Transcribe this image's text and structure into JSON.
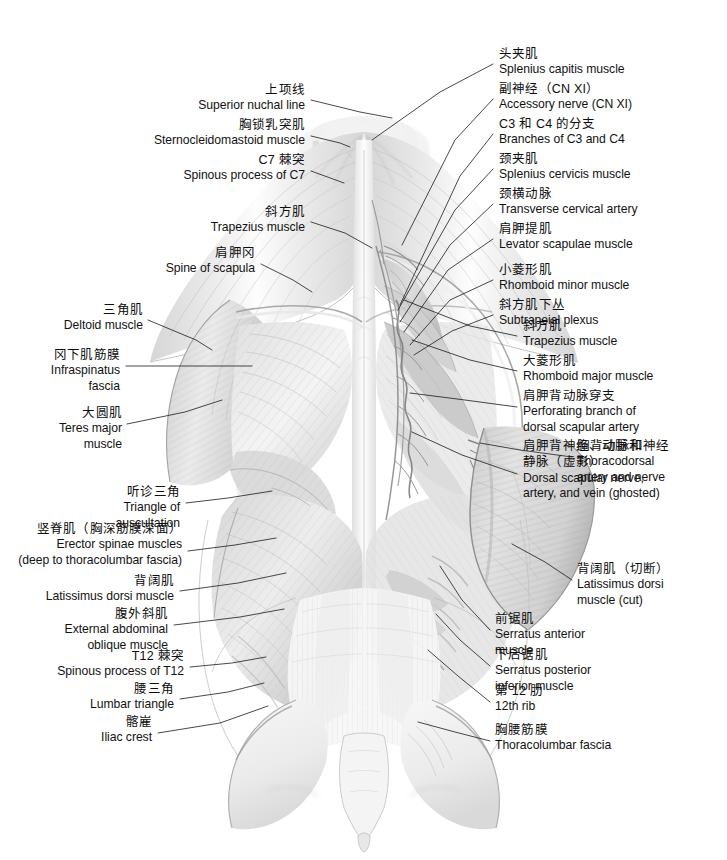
{
  "plate": {
    "title": "Muscles of the back — superficial and intermediate layers",
    "view": "posterior",
    "style": "grayscale medical illustration",
    "width": 727,
    "height": 860,
    "background_color": "#ffffff",
    "ink_color": "#111111",
    "leader_color": "#1a1a1a"
  },
  "labels_left": [
    {
      "id": "superior-nuchal-line",
      "cn": "上项线",
      "en": [
        "Superior nuchal line"
      ],
      "text_x": 305,
      "text_y": 82,
      "leader": [
        [
          311,
          100
        ],
        [
          360,
          112
        ],
        [
          392,
          118
        ]
      ]
    },
    {
      "id": "sternocleidomastoid-muscle",
      "cn": "胸锁乳突肌",
      "en": [
        "Sternocleidomastoid muscle"
      ],
      "text_x": 305,
      "text_y": 117,
      "leader": [
        [
          311,
          136
        ],
        [
          340,
          143
        ],
        [
          350,
          147
        ]
      ]
    },
    {
      "id": "spinous-process-of-c7",
      "cn": "C7 棘突",
      "en": [
        "Spinous process of C7"
      ],
      "text_x": 305,
      "text_y": 152,
      "leader": [
        [
          311,
          171
        ],
        [
          344,
          183
        ]
      ]
    },
    {
      "id": "trapezius-muscle-left",
      "cn": "斜方肌",
      "en": [
        "Trapezius muscle"
      ],
      "text_x": 305,
      "text_y": 204,
      "leader": [
        [
          311,
          222
        ],
        [
          345,
          233
        ],
        [
          372,
          248
        ]
      ]
    },
    {
      "id": "spine-of-scapula",
      "cn": "肩胛冈",
      "en": [
        "Spine of scapula"
      ],
      "text_x": 255,
      "text_y": 245,
      "leader": [
        [
          261,
          264
        ],
        [
          293,
          280
        ],
        [
          312,
          292
        ]
      ]
    },
    {
      "id": "deltoid-muscle",
      "cn": "三角肌",
      "en": [
        "Deltoid muscle"
      ],
      "text_x": 143,
      "text_y": 302,
      "leader": [
        [
          148,
          320
        ],
        [
          196,
          340
        ],
        [
          212,
          350
        ]
      ]
    },
    {
      "id": "infraspinatus-fascia",
      "cn": "冈下肌筋膜",
      "en": [
        "Infraspinatus",
        "fascia"
      ],
      "text_x": 120,
      "text_y": 347,
      "leader": [
        [
          126,
          366
        ],
        [
          200,
          366
        ],
        [
          252,
          366
        ]
      ]
    },
    {
      "id": "teres-major-muscle",
      "cn": "大圆肌",
      "en": [
        "Teres major",
        "muscle"
      ],
      "text_x": 122,
      "text_y": 405,
      "leader": [
        [
          127,
          424
        ],
        [
          185,
          412
        ],
        [
          222,
          400
        ]
      ]
    },
    {
      "id": "triangle-of-auscultation",
      "cn": "听诊三角",
      "en": [
        "Triangle of",
        "auscultation"
      ],
      "text_x": 180,
      "text_y": 484,
      "leader": [
        [
          186,
          503
        ],
        [
          228,
          498
        ],
        [
          272,
          491
        ]
      ]
    },
    {
      "id": "erector-spinae-muscles",
      "cn": "竖脊肌（胸深筋膜深面）",
      "en": [
        "Erector spinae muscles",
        "(deep to thoracolumbar fascia)"
      ],
      "text_x": 182,
      "text_y": 521,
      "leader": [
        [
          188,
          551
        ],
        [
          235,
          545
        ],
        [
          276,
          538
        ]
      ]
    },
    {
      "id": "latissimus-dorsi-muscle-left",
      "cn": "背阔肌",
      "en": [
        "Latissimus dorsi muscle"
      ],
      "text_x": 174,
      "text_y": 573,
      "leader": [
        [
          180,
          591
        ],
        [
          238,
          583
        ],
        [
          286,
          573
        ]
      ]
    },
    {
      "id": "external-abdominal-oblique-muscle",
      "cn": "腹外斜肌",
      "en": [
        "External abdominal",
        "oblique muscle"
      ],
      "text_x": 168,
      "text_y": 606,
      "leader": [
        [
          174,
          625
        ],
        [
          240,
          617
        ],
        [
          284,
          609
        ]
      ]
    },
    {
      "id": "spinous-process-of-t12",
      "cn": "T12 棘突",
      "en": [
        "Spinous process of T12"
      ],
      "text_x": 184,
      "text_y": 648,
      "leader": [
        [
          190,
          667
        ],
        [
          232,
          663
        ],
        [
          266,
          657
        ]
      ]
    },
    {
      "id": "lumbar-triangle",
      "cn": "腰三角",
      "en": [
        "Lumbar triangle"
      ],
      "text_x": 174,
      "text_y": 681,
      "leader": [
        [
          180,
          699
        ],
        [
          228,
          692
        ],
        [
          264,
          683
        ]
      ]
    },
    {
      "id": "iliac-crest",
      "cn": "髂嵟",
      "en": [
        "Iliac crest"
      ],
      "text_x": 152,
      "text_y": 714,
      "leader": [
        [
          158,
          733
        ],
        [
          220,
          723
        ],
        [
          268,
          706
        ]
      ]
    }
  ],
  "labels_right": [
    {
      "id": "splenius-capitis-muscle",
      "cn": "头夹肌",
      "en": [
        "Splenius capitis muscle"
      ],
      "text_x": 499,
      "text_y": 46,
      "leader": [
        [
          493,
          64
        ],
        [
          440,
          92
        ],
        [
          372,
          140
        ]
      ]
    },
    {
      "id": "accessory-nerve-cn-xi",
      "cn": "副神经（CN XI）",
      "en": [
        "Accessory nerve (CN XI)"
      ],
      "text_x": 499,
      "text_y": 81,
      "leader": [
        [
          493,
          99
        ],
        [
          455,
          140
        ],
        [
          402,
          245
        ]
      ]
    },
    {
      "id": "branches-of-c3-and-c4",
      "cn": "C3 和 C4 的分支",
      "en": [
        "Branches of C3 and C4"
      ],
      "text_x": 499,
      "text_y": 116,
      "leader": [
        [
          493,
          134
        ],
        [
          460,
          176
        ],
        [
          400,
          305
        ]
      ]
    },
    {
      "id": "splenius-cervicis-muscle",
      "cn": "颈夹肌",
      "en": [
        "Splenius cervicis muscle"
      ],
      "text_x": 499,
      "text_y": 151,
      "leader": [
        [
          493,
          169
        ],
        [
          455,
          210
        ],
        [
          398,
          310
        ]
      ]
    },
    {
      "id": "transverse-cervical-artery",
      "cn": "颈横动脉",
      "en": [
        "Transverse cervical artery"
      ],
      "text_x": 499,
      "text_y": 186,
      "leader": [
        [
          493,
          204
        ],
        [
          450,
          245
        ],
        [
          400,
          322
        ]
      ]
    },
    {
      "id": "levator-scapulae-muscle",
      "cn": "肩胛提肌",
      "en": [
        "Levator scapulae muscle"
      ],
      "text_x": 499,
      "text_y": 221,
      "leader": [
        [
          493,
          239
        ],
        [
          448,
          270
        ],
        [
          404,
          332
        ]
      ]
    },
    {
      "id": "rhomboid-minor-muscle",
      "cn": "小菱形肌",
      "en": [
        "Rhomboid minor muscle"
      ],
      "text_x": 499,
      "text_y": 262,
      "leader": [
        [
          493,
          280
        ],
        [
          450,
          300
        ],
        [
          410,
          345
        ]
      ]
    },
    {
      "id": "subtrapeial-plexus",
      "cn": "斜方肌下丛",
      "en": [
        "Subtrapeial plexus"
      ],
      "text_x": 499,
      "text_y": 297,
      "leader": [
        [
          493,
          315
        ],
        [
          452,
          331
        ],
        [
          414,
          355
        ]
      ]
    },
    {
      "id": "trapezius-muscle-right",
      "cn": "斜方肌",
      "en": [
        "Trapezius muscle"
      ],
      "text_x": 523,
      "text_y": 318,
      "leader": [
        [
          517,
          336
        ],
        [
          470,
          326
        ],
        [
          404,
          300
        ]
      ]
    },
    {
      "id": "rhomboid-major-muscle",
      "cn": "大菱形肌",
      "en": [
        "Rhomboid major muscle"
      ],
      "text_x": 523,
      "text_y": 353,
      "leader": [
        [
          517,
          371
        ],
        [
          470,
          360
        ],
        [
          412,
          340
        ]
      ]
    },
    {
      "id": "perforating-branch-dorsal-scapular-artery",
      "cn": "肩胛背动脉穿支",
      "en": [
        "Perforating branch of",
        "dorsal scapular artery"
      ],
      "text_x": 523,
      "text_y": 388,
      "leader": [
        [
          517,
          407
        ],
        [
          465,
          400
        ],
        [
          410,
          393
        ]
      ]
    },
    {
      "id": "dorsal-scapular-nerve-artery-vein",
      "cn": "肩胛背神经、动脉和\n静脉（虚影）",
      "cn_line1": "肩胛背神经、动脉和",
      "cn_line2": "静脉（虚影）",
      "en": [
        "Dorsal scapular nerve,",
        "artery, and vein (ghosted)"
      ],
      "text_x": 523,
      "text_y": 438,
      "leader": [
        [
          517,
          474
        ],
        [
          462,
          455
        ],
        [
          412,
          432
        ]
      ]
    },
    {
      "id": "thoracodorsal-artery-and-nerve",
      "cn": "胸背动脉和神经",
      "en": [
        "Thoracodorsal",
        "artery and nerve"
      ],
      "text_x": 577,
      "text_y": 438,
      "leader": [
        [
          572,
          457
        ],
        [
          520,
          450
        ],
        [
          480,
          443
        ]
      ]
    },
    {
      "id": "latissimus-dorsi-muscle-cut",
      "cn": "背阔肌（切断）",
      "en": [
        "Latissimus dorsi",
        "muscle (cut)"
      ],
      "text_x": 577,
      "text_y": 561,
      "leader": [
        [
          572,
          580
        ],
        [
          545,
          562
        ],
        [
          512,
          544
        ]
      ]
    },
    {
      "id": "serratus-anterior-muscle",
      "cn": "前锯肌",
      "en": [
        "Serratus anterior",
        "muscle"
      ],
      "text_x": 495,
      "text_y": 611,
      "leader": [
        [
          490,
          630
        ],
        [
          462,
          600
        ],
        [
          440,
          566
        ]
      ]
    },
    {
      "id": "serratus-posterior-inferior-muscle",
      "cn": "下后锯肌",
      "en": [
        "Serratus posterior",
        "inferior muscle"
      ],
      "text_x": 495,
      "text_y": 647,
      "leader": [
        [
          490,
          666
        ],
        [
          460,
          640
        ],
        [
          436,
          614
        ]
      ]
    },
    {
      "id": "twelfth-rib",
      "cn": "第 12 肋",
      "en": [
        "12th rib"
      ],
      "text_x": 495,
      "text_y": 683,
      "leader": [
        [
          490,
          702
        ],
        [
          458,
          676
        ],
        [
          428,
          650
        ]
      ]
    },
    {
      "id": "thoracolumbar-fascia",
      "cn": "胸腰筋膜",
      "en": [
        "Thoracolumbar fascia"
      ],
      "text_x": 495,
      "text_y": 722,
      "leader": [
        [
          490,
          741
        ],
        [
          455,
          732
        ],
        [
          418,
          722
        ]
      ]
    }
  ],
  "figure": {
    "name": "back-anatomy-illustration",
    "regions": [
      "trapezius",
      "deltoid",
      "infraspinatus-fascia",
      "teres-major",
      "latissimus-dorsi",
      "latissimus-dorsi-cut-flap",
      "serratus-posterior-inferior",
      "erector-spinae",
      "thoracolumbar-fascia",
      "iliac-crest",
      "sacrum",
      "rhomboid-major",
      "rhomboid-minor",
      "levator-scapulae",
      "splenius-capitis",
      "splenius-cervicis",
      "external-abdominal-oblique"
    ],
    "palette": {
      "paper": "#ffffff",
      "muscle_light": "#efefef",
      "muscle_mid": "#d8d8d8",
      "muscle_dark": "#b9b9b9",
      "muscle_deep": "#9a9a9a",
      "shadow": "#8a8a8a",
      "outline": "#6f6f6f",
      "vessel": "#7a7a7a",
      "highlight": "#fbfbfb"
    }
  }
}
